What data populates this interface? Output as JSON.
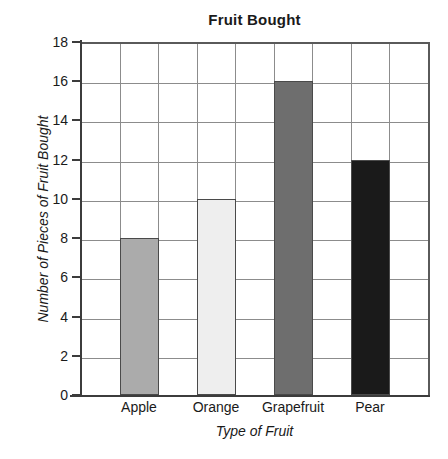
{
  "chart_data": {
    "type": "bar",
    "title": "Fruit Bought",
    "xlabel": "Type of Fruit",
    "ylabel": "Number of Pieces of Fruit Bought",
    "categories": [
      "Apple",
      "Orange",
      "Grapefruit",
      "Pear"
    ],
    "values": [
      8,
      10,
      16,
      12
    ],
    "bar_colors": [
      "#ababab",
      "#eeeeee",
      "#6e6e6e",
      "#1a1a1a"
    ],
    "bar_border_color": "#4a4a4a",
    "ylim": [
      0,
      18
    ],
    "ytick_step": 2,
    "ytick_labels": [
      "18",
      "16",
      "14",
      "12",
      "10",
      "8",
      "6",
      "4",
      "2",
      "0"
    ],
    "ytick_values": [
      18,
      16,
      14,
      12,
      10,
      8,
      6,
      4,
      2,
      0
    ],
    "grid": "both",
    "vertical_grid_columns": 9,
    "legend": "none",
    "background_color": "#ffffff",
    "grid_color": "#8c8c8c",
    "axis_color": "#3c3c3c"
  }
}
